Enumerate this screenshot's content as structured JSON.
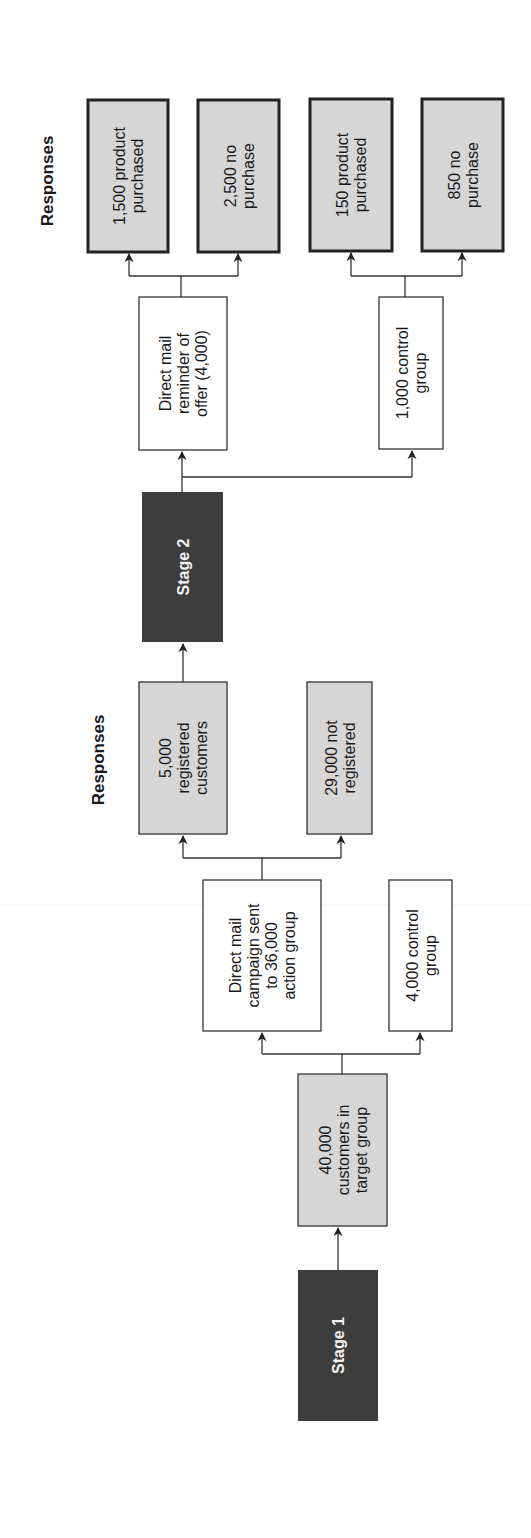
{
  "colors": {
    "stage_fill": "#3d3d3d",
    "response_fill": "#d6d6d6",
    "action_fill": "#ffffff",
    "border": "#333333",
    "stage_text": "#f2f2f2"
  },
  "orientation": "rotated 90 degrees counter-clockwise; flow runs bottom to top",
  "stage1": {
    "stage_label": "Stage 1",
    "target": {
      "lines": [
        "40,000",
        "customers in",
        "target group"
      ]
    },
    "action": {
      "lines": [
        "Direct mail",
        "campaign sent",
        "to 36,000",
        "action group"
      ]
    },
    "control": {
      "lines": [
        "4,000 control",
        "group"
      ]
    },
    "responses_label": "Responses",
    "responses": [
      {
        "lines": [
          "5,000",
          "registered",
          "customers"
        ]
      },
      {
        "lines": [
          "29,000 not",
          "registered"
        ]
      }
    ]
  },
  "stage2": {
    "stage_label": "Stage 2",
    "action": {
      "lines": [
        "Direct mail",
        "reminder of",
        "offer (4,000)"
      ]
    },
    "control": {
      "lines": [
        "1,000 control",
        "group"
      ]
    },
    "responses_label": "Responses",
    "responses": [
      {
        "lines": [
          "1,500 product",
          "purchased"
        ]
      },
      {
        "lines": [
          "2,500 no",
          "purchase"
        ]
      },
      {
        "lines": [
          "150 product",
          "purchased"
        ]
      },
      {
        "lines": [
          "850 no",
          "purchase"
        ]
      }
    ]
  }
}
